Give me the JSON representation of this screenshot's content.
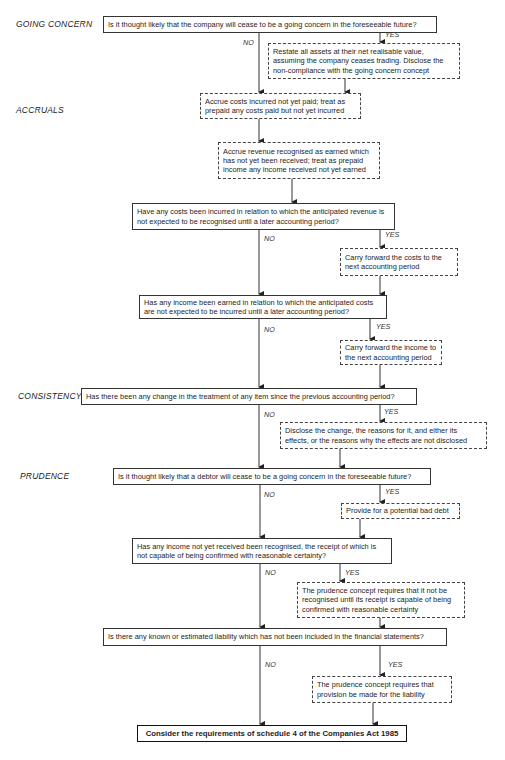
{
  "sections": {
    "going_concern": "GOING CONCERN",
    "accruals": "ACCRUALS",
    "consistency": "CONSISTENCY",
    "prudence": "PRUDENCE"
  },
  "labels": {
    "yes": "YES",
    "no": "NO"
  },
  "nodes": {
    "q_going_concern": "Is it thought likely that the company will cease to be a going concern in the foreseeable future?",
    "a_restate_assets": "Restate all assets at their net realisable value, assuming the company ceases trading.  Disclose the non-compliance with the going concern concept",
    "a_accrue_costs": "Accrue costs incurred not yet paid; treat as prepaid any costs paid but not yet incurred",
    "a_accrue_revenue": "Accrue revenue recognised as earned which has not yet been received; treat as prepaid income any income received not yet earned",
    "q_costs_incurred": "Have any costs been incurred in relation to which the anticipated revenue is not expected to be recognised until a later accounting period?",
    "a_carry_costs": "Carry forward the costs to the next accounting period",
    "q_income_earned": "Has any income been earned in relation to which the anticipated costs are not expected to be incurred until a later accounting period?",
    "a_carry_income": "Carry forward the income to the next accounting period",
    "q_consistency": "Has there been any change in the treatment of any item since the previous accounting period?",
    "a_disclose_change": "Disclose the change, the reasons for it, and either its effects, or the reasons why the effects are not disclosed",
    "q_debtor": "Is it thought likely that a debtor will cease to be a going concern in the foreseeable future?",
    "a_bad_debt": "Provide for a potential bad debt",
    "q_income_not_received": "Has any income not yet received been recognised, the receipt of which is not capable of being confirmed with reasonable certainty?",
    "a_prudence_income": "The prudence concept requires that it not be recognised until its receipt is capable of being confirmed with reasonable certainty",
    "q_liability": "Is there any known or estimated liability which has not been included in the financial statements?",
    "a_prudence_liability": "The prudence concept requires that provision be made for the liability",
    "final": "Consider the requirements of schedule 4 of the Companies Act 1985"
  }
}
